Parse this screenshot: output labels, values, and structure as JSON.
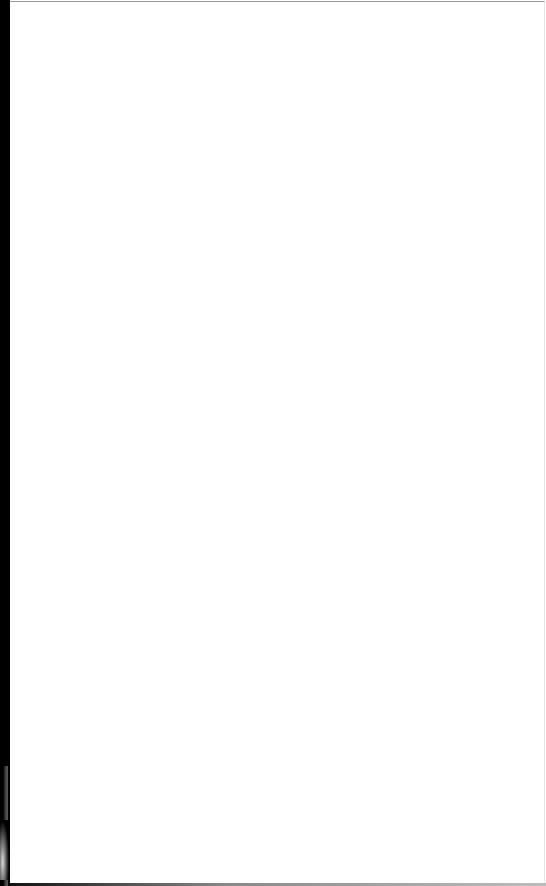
{
  "document": {
    "type": "scanned-page",
    "content": "",
    "page_state": "blank"
  },
  "colors": {
    "page": "#ffffff",
    "scan_edge": "#000000",
    "border": "#9a9a9a"
  }
}
